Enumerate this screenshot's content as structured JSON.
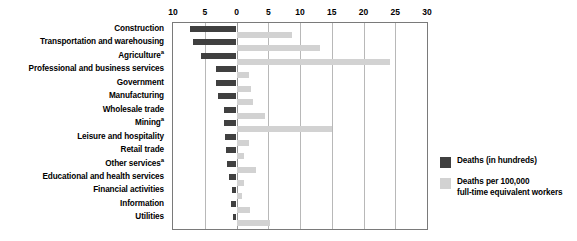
{
  "chart_data": {
    "type": "bar",
    "orientation": "horizontal",
    "title": "",
    "subtitle": "",
    "xlabel": "",
    "ylabel": "",
    "grid": true,
    "legend_position": "right-bottom",
    "axis": {
      "left_max": 10,
      "right_max": 30,
      "zero_position_value": 0,
      "tick_labels": [
        "10",
        "5",
        "0",
        "5",
        "10",
        "15",
        "20",
        "25",
        "30"
      ],
      "tick_values": [
        -10,
        -5,
        0,
        5,
        10,
        15,
        20,
        25,
        30
      ],
      "tick_interval": 5,
      "note": "Diverging axis: left side shows Deaths (in hundreds) 10 to 0; right side shows Deaths per 100,000 full-time equivalent workers 0 to 30"
    },
    "categories": [
      "Construction",
      "Transportation and warehousing",
      "Agriculture",
      "Professional and business services",
      "Government",
      "Manufacturing",
      "Wholesale trade",
      "Mining",
      "Leisure and hospitality",
      "Retail trade",
      "Other services",
      "Educational and health services",
      "Financial activities",
      "Information",
      "Utilities"
    ],
    "category_footnotes": {
      "Agriculture": "a",
      "Mining": "a",
      "Other services": "a"
    },
    "series": [
      {
        "name": "Deaths (in hundreds)",
        "color": "#404040",
        "side": "left",
        "values": [
          7.3,
          6.8,
          5.6,
          3.3,
          3.3,
          2.9,
          2.0,
          2.0,
          1.8,
          1.7,
          1.5,
          1.2,
          0.7,
          0.8,
          0.5
        ]
      },
      {
        "name": "Deaths per 100,000\nfull-time equivalent workers",
        "color": "#d2d2d2",
        "side": "right",
        "values": [
          8.8,
          13.2,
          24.1,
          2.0,
          2.3,
          2.6,
          4.5,
          15.0,
          1.9,
          1.2,
          3.0,
          1.2,
          0.8,
          2.1,
          5.3
        ]
      }
    ]
  },
  "legend": {
    "items": [
      {
        "label": "Deaths (in hundreds)",
        "color": "#404040"
      },
      {
        "label": "Deaths per 100,000\nfull-time equivalent workers",
        "color": "#d2d2d2"
      }
    ]
  },
  "colors": {
    "dark_series": "#404040",
    "light_series": "#d2d2d2",
    "gridline": "#b8b8b8",
    "plot_border": "#7a7a7a",
    "background": "#ffffff",
    "text": "#000000"
  }
}
